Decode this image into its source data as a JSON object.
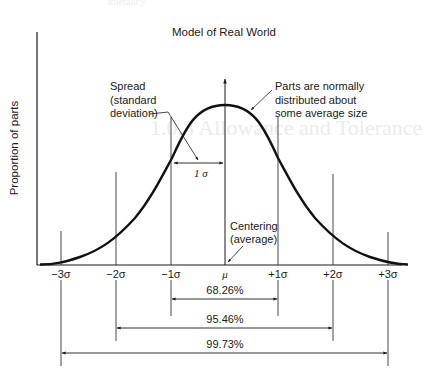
{
  "diagram": {
    "title": "Model of Real World",
    "y_axis_label": "Proportion of parts",
    "annotations": {
      "spread_line1": "Spread",
      "spread_line2": "(standard",
      "spread_line3": "deviation)",
      "parts_line1": "Parts are normally",
      "parts_line2": "distributed about",
      "parts_line3": "some average size",
      "centering_line1": "Centering",
      "centering_line2": "(average)",
      "one_sigma": "1 σ"
    },
    "x_ticks": [
      "−3σ",
      "−2σ",
      "−1σ",
      "μ",
      "+1σ",
      "+2σ",
      "+3σ"
    ],
    "ranges": [
      {
        "label": "68.26%",
        "from": "−1σ",
        "to": "+1σ"
      },
      {
        "label": "95.46%",
        "from": "−2σ",
        "to": "+2σ"
      },
      {
        "label": "99.73%",
        "from": "−3σ",
        "to": "+3σ"
      }
    ],
    "colors": {
      "ink": "#1a1a1a",
      "curve": "#111111",
      "background": "#ffffff"
    }
  },
  "background_bleed": {
    "top_line": "tolerancy.",
    "section_heading": "1.0.3  Allowance and Tolerance"
  }
}
